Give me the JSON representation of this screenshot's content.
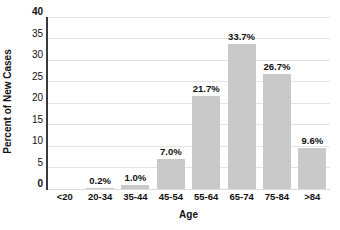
{
  "chart_data": {
    "type": "bar",
    "title": "",
    "xlabel": "Age",
    "ylabel": "Percent of New Cases",
    "categories": [
      "<20",
      "20-34",
      "35-44",
      "45-54",
      "55-64",
      "65-74",
      "75-84",
      ">84"
    ],
    "values": [
      0,
      0.2,
      1.0,
      7.0,
      21.7,
      33.7,
      26.7,
      9.6
    ],
    "bar_labels": [
      "",
      "0.2%",
      "1.0%",
      "7.0%",
      "21.7%",
      "33.7%",
      "26.7%",
      "9.6%"
    ],
    "ylim": [
      0,
      40
    ],
    "yticks": [
      0,
      5,
      10,
      15,
      20,
      25,
      30,
      35,
      40
    ],
    "bold_yticks": [
      0,
      40
    ],
    "grid": true,
    "legend": "none",
    "colors": {
      "bar_fill": "#c9c9c9",
      "gridline": "#e4e4e4",
      "axis_line": "#3a3a3a",
      "text": "#111111",
      "background": "#ffffff"
    }
  }
}
